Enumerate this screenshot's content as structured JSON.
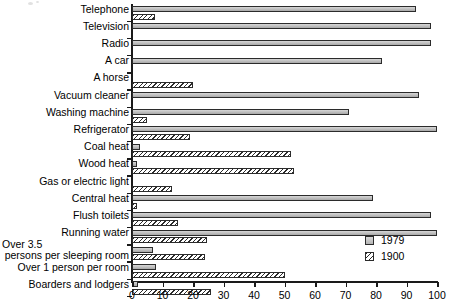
{
  "chart_data": {
    "type": "bar",
    "orientation": "horizontal",
    "title": "",
    "xlabel": "",
    "ylabel": "",
    "xlim": [
      0,
      100
    ],
    "xticks": [
      0,
      10,
      20,
      30,
      40,
      50,
      60,
      70,
      80,
      90,
      100
    ],
    "grid": false,
    "legend_position": "right-inside",
    "categories": [
      "Telephone",
      "Television",
      "Radio",
      "A car",
      "A horse",
      "Vacuum cleaner",
      "Washing machine",
      "Refrigerator",
      "Coal heat",
      "Wood heat",
      "Gas or electric light",
      "Central heat",
      "Flush toilets",
      "Running water",
      "Over 3.5 persons per sleeping room",
      "Over 1 person per room",
      "Boarders and lodgers"
    ],
    "series": [
      {
        "name": "1979",
        "color": "#c2c2c2",
        "values": [
          93,
          98,
          98,
          82,
          0,
          94,
          71,
          100,
          2.5,
          1.5,
          0,
          79,
          98,
          100,
          7,
          8,
          2
        ]
      },
      {
        "name": "1900",
        "color": "#ffffff",
        "pattern": "diagonal-hatch",
        "values": [
          7.5,
          0,
          0,
          0,
          20,
          0,
          5,
          19,
          52,
          53,
          13,
          1.5,
          15,
          24.5,
          24,
          50,
          26
        ]
      }
    ]
  },
  "categories_display": [
    {
      "text": "Telephone",
      "lines": null
    },
    {
      "text": "Television",
      "lines": null
    },
    {
      "text": "Radio",
      "lines": null
    },
    {
      "text": "A car",
      "lines": null
    },
    {
      "text": "A horse",
      "lines": null
    },
    {
      "text": "Vacuum cleaner",
      "lines": null
    },
    {
      "text": "Washing machine",
      "lines": null
    },
    {
      "text": "Refrigerator",
      "lines": null
    },
    {
      "text": "Coal heat",
      "lines": null
    },
    {
      "text": "Wood heat",
      "lines": null
    },
    {
      "text": "Gas or electric light",
      "lines": null
    },
    {
      "text": "Central heat",
      "lines": null
    },
    {
      "text": "Flush toilets",
      "lines": null
    },
    {
      "text": "Running water",
      "lines": null
    },
    {
      "text": "",
      "lines": [
        "Over 3.5",
        "persons per sleeping room"
      ]
    },
    {
      "text": "Over 1 person per room",
      "lines": null
    },
    {
      "text": "Boarders and lodgers",
      "lines": null
    }
  ],
  "axis": {
    "tick_labels": [
      "0",
      "10",
      "20",
      "30",
      "40",
      "50",
      "60",
      "70",
      "80",
      "90",
      "100"
    ]
  },
  "legend": {
    "items": [
      {
        "label": "1979",
        "swatch": "solid-gray-square"
      },
      {
        "label": "1900",
        "swatch": "hatched-square"
      }
    ]
  }
}
